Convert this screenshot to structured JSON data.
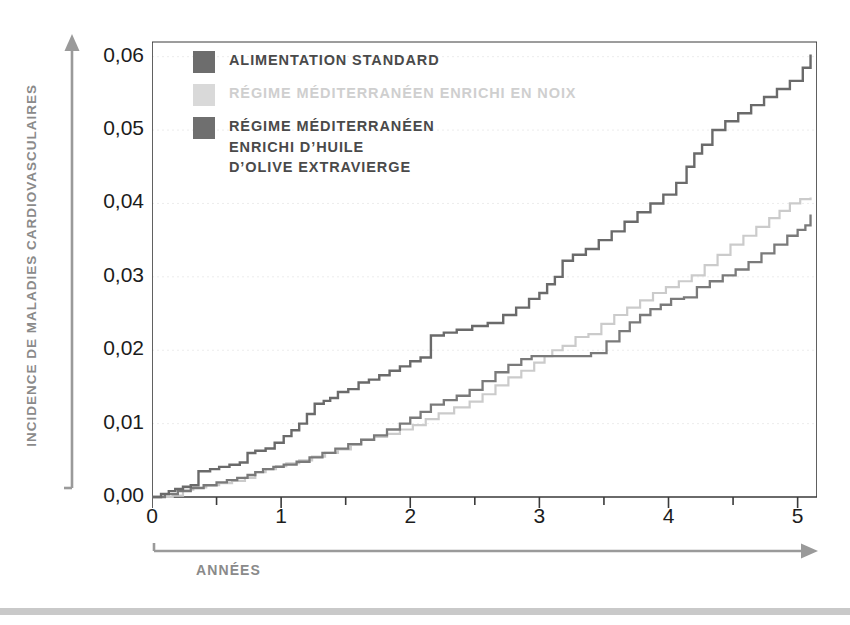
{
  "figure": {
    "background_color": "#ffffff",
    "bottom_rule_color": "#c9c9c9"
  },
  "axes": {
    "y_title": "Incidence de maladies cardiovasculaires",
    "x_title": "Années",
    "y_tick_labels": [
      "0,00",
      "0,01",
      "0,02",
      "0,03",
      "0,04",
      "0,05",
      "0,06"
    ],
    "x_tick_labels": [
      "0",
      "1",
      "2",
      "3",
      "4",
      "5"
    ],
    "y_minor_note": "",
    "axis_color": "#8a8a8a",
    "frame_color": "#3a3a3a",
    "gridline_color": "#ececec"
  },
  "legend": {
    "items": [
      {
        "label": "Alimentation standard",
        "color": "#6d6d6d",
        "text_color": "#4a4a4a",
        "swatch_name": "legend-swatch-standard"
      },
      {
        "label": "Régime méditerranéen enrichi en noix",
        "color": "#d9d9d9",
        "text_color": "#cfcfcf",
        "swatch_name": "legend-swatch-walnuts"
      },
      {
        "label": "Régime méditerranéen\nenrichi d’huile\nd’olive extravierge",
        "color": "#6f6f6f",
        "text_color": "#4a4a4a",
        "swatch_name": "legend-swatch-olive-oil"
      }
    ]
  },
  "chart_data": {
    "type": "line",
    "title": "",
    "xlabel": "Années",
    "ylabel": "Incidence de maladies cardiovasculaires",
    "xlim": [
      0,
      5.15
    ],
    "ylim": [
      0,
      0.062
    ],
    "xticks": [
      0,
      0.5,
      1,
      1.5,
      2,
      2.5,
      3,
      3.5,
      4,
      4.5,
      5
    ],
    "xtick_major": [
      0,
      1,
      2,
      3,
      4,
      5
    ],
    "yticks": [
      0.0,
      0.01,
      0.02,
      0.03,
      0.04,
      0.05,
      0.06
    ],
    "grid": "horizontal-dotted-faint",
    "legend_position": "upper-left-inside",
    "step_style": "post",
    "series": [
      {
        "name": "Alimentation standard",
        "color": "#6a6a6a",
        "width": 2.4,
        "x": [
          0.0,
          0.07,
          0.13,
          0.18,
          0.24,
          0.3,
          0.36,
          0.45,
          0.52,
          0.6,
          0.68,
          0.74,
          0.8,
          0.88,
          0.95,
          1.02,
          1.08,
          1.14,
          1.2,
          1.26,
          1.33,
          1.38,
          1.44,
          1.52,
          1.6,
          1.68,
          1.76,
          1.84,
          1.92,
          2.0,
          2.08,
          2.16,
          2.26,
          2.36,
          2.48,
          2.6,
          2.72,
          2.82,
          2.92,
          3.0,
          3.06,
          3.12,
          3.18,
          3.26,
          3.36,
          3.46,
          3.56,
          3.66,
          3.76,
          3.86,
          3.96,
          4.06,
          4.14,
          4.2,
          4.26,
          4.34,
          4.44,
          4.54,
          4.64,
          4.74,
          4.84,
          4.94,
          5.04,
          5.1
        ],
        "y": [
          0.0,
          0.0004,
          0.0008,
          0.0011,
          0.0014,
          0.0016,
          0.0035,
          0.0038,
          0.0041,
          0.0044,
          0.0047,
          0.006,
          0.0063,
          0.0066,
          0.0074,
          0.0083,
          0.0091,
          0.01,
          0.0113,
          0.0127,
          0.0131,
          0.0135,
          0.0143,
          0.0147,
          0.0156,
          0.016,
          0.0166,
          0.0172,
          0.0178,
          0.0185,
          0.019,
          0.022,
          0.0224,
          0.0228,
          0.0233,
          0.0237,
          0.0248,
          0.0258,
          0.027,
          0.0278,
          0.029,
          0.03,
          0.0322,
          0.033,
          0.0338,
          0.035,
          0.0362,
          0.0375,
          0.0388,
          0.04,
          0.0412,
          0.0428,
          0.045,
          0.0468,
          0.048,
          0.05,
          0.0512,
          0.0523,
          0.0534,
          0.0545,
          0.0556,
          0.0567,
          0.0585,
          0.0603
        ]
      },
      {
        "name": "Régime méditerranéen enrichi en noix",
        "color": "#cbcbcb",
        "width": 2.2,
        "x": [
          0.0,
          0.16,
          0.24,
          0.32,
          0.42,
          0.52,
          0.62,
          0.72,
          0.8,
          0.88,
          0.96,
          1.04,
          1.14,
          1.24,
          1.34,
          1.44,
          1.54,
          1.62,
          1.72,
          1.82,
          1.92,
          2.02,
          2.12,
          2.22,
          2.34,
          2.46,
          2.56,
          2.66,
          2.76,
          2.86,
          2.96,
          3.04,
          3.1,
          3.18,
          3.28,
          3.38,
          3.48,
          3.58,
          3.68,
          3.78,
          3.88,
          3.98,
          4.08,
          4.18,
          4.28,
          4.38,
          4.48,
          4.58,
          4.68,
          4.78,
          4.86,
          4.94,
          5.02,
          5.1
        ],
        "y": [
          0.0,
          0.0002,
          0.001,
          0.0013,
          0.0016,
          0.0019,
          0.0022,
          0.0026,
          0.0034,
          0.0038,
          0.0042,
          0.0046,
          0.005,
          0.0055,
          0.006,
          0.0065,
          0.0071,
          0.0078,
          0.0082,
          0.0086,
          0.0092,
          0.0098,
          0.0106,
          0.0114,
          0.0122,
          0.013,
          0.014,
          0.0152,
          0.0163,
          0.0172,
          0.0183,
          0.0192,
          0.02,
          0.0206,
          0.0218,
          0.0222,
          0.0236,
          0.0248,
          0.0258,
          0.0268,
          0.0278,
          0.0286,
          0.0294,
          0.0302,
          0.0316,
          0.033,
          0.0344,
          0.0356,
          0.0368,
          0.038,
          0.039,
          0.04,
          0.0406,
          0.0408
        ]
      },
      {
        "name": "Régime méditerranéen enrichi d’huile d’olive extravierge",
        "color": "#7a7a7a",
        "width": 2.3,
        "x": [
          0.0,
          0.1,
          0.2,
          0.3,
          0.4,
          0.5,
          0.58,
          0.66,
          0.74,
          0.8,
          0.86,
          0.94,
          1.02,
          1.12,
          1.22,
          1.32,
          1.42,
          1.52,
          1.62,
          1.72,
          1.82,
          1.92,
          2.0,
          2.08,
          2.16,
          2.26,
          2.36,
          2.46,
          2.56,
          2.66,
          2.76,
          2.86,
          2.94,
          3.02,
          3.14,
          3.28,
          3.4,
          3.52,
          3.62,
          3.7,
          3.78,
          3.86,
          3.94,
          4.02,
          4.12,
          4.22,
          4.32,
          4.42,
          4.52,
          4.62,
          4.72,
          4.82,
          4.92,
          5.0,
          5.06,
          5.1
        ],
        "y": [
          0.0,
          0.0004,
          0.0008,
          0.0012,
          0.0016,
          0.002,
          0.0023,
          0.0026,
          0.003,
          0.0034,
          0.0038,
          0.0041,
          0.0044,
          0.0048,
          0.0054,
          0.006,
          0.0066,
          0.0072,
          0.0078,
          0.0084,
          0.0092,
          0.01,
          0.0108,
          0.0116,
          0.0126,
          0.0132,
          0.0138,
          0.0146,
          0.0158,
          0.017,
          0.018,
          0.0188,
          0.0192,
          0.0192,
          0.0192,
          0.0192,
          0.0196,
          0.0212,
          0.0226,
          0.0238,
          0.0248,
          0.0256,
          0.0262,
          0.027,
          0.0272,
          0.0286,
          0.0294,
          0.0302,
          0.031,
          0.032,
          0.0332,
          0.0344,
          0.0356,
          0.0364,
          0.037,
          0.0385
        ]
      }
    ]
  }
}
